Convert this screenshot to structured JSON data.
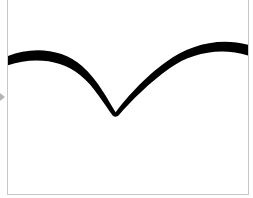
{
  "canvas": {
    "role": "drawing-pad",
    "background": "#ffffff",
    "border_color": "#c8c8c8",
    "stroke": {
      "color": "#000000",
      "description": "hand-drawn curve: arc down to a V-shaped cusp, then arc up"
    }
  },
  "side_marker": {
    "icon": "triangle-right-icon",
    "color": "#b4b4b4"
  }
}
